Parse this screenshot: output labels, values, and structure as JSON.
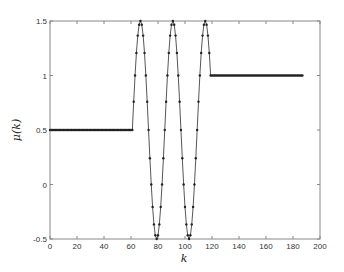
{
  "chart_data": {
    "type": "line",
    "title": "",
    "xlabel": "k",
    "ylabel": "μ(k)",
    "xlim": [
      0,
      200
    ],
    "ylim": [
      -0.5,
      1.5
    ],
    "xticks": [
      0,
      20,
      40,
      60,
      80,
      100,
      120,
      140,
      160,
      180,
      200
    ],
    "yticks": [
      -0.5,
      0,
      0.5,
      1,
      1.5
    ],
    "xtick_labels": [
      "0",
      "20",
      "40",
      "60",
      "80",
      "100",
      "120",
      "140",
      "160",
      "180",
      "200"
    ],
    "ytick_labels": [
      "-0.5",
      "0",
      "0.5",
      "1",
      "1.5"
    ],
    "grid": false,
    "legend": null,
    "series": [
      {
        "name": "μ(k)",
        "marker": "dot",
        "line_color": "#444444",
        "marker_color": "#222222",
        "segments": [
          {
            "k_start": 0,
            "k_end": 60,
            "value": 0.5
          },
          {
            "k_start": 61,
            "k_end": 118,
            "formula": "0.5 + cos(2π(k-67)/24)"
          },
          {
            "k_start": 119,
            "k_end": 187,
            "value": 1.0
          }
        ],
        "oscillation_k": [
          61,
          62,
          63,
          64,
          65,
          66,
          67,
          68,
          69,
          70,
          71,
          72,
          73,
          74,
          75,
          76,
          77,
          78,
          79,
          80,
          81,
          82,
          83,
          84,
          85,
          86,
          87,
          88,
          89,
          90,
          91,
          92,
          93,
          94,
          95,
          96,
          97,
          98,
          99,
          100,
          101,
          102,
          103,
          104,
          105,
          106,
          107,
          108,
          109,
          110,
          111,
          112,
          113,
          114,
          115,
          116,
          117,
          118
        ],
        "oscillation_values": [
          0.5,
          0.759,
          1.0,
          1.207,
          1.366,
          1.466,
          1.5,
          1.466,
          1.366,
          1.207,
          1.0,
          0.759,
          0.5,
          0.241,
          0.0,
          -0.207,
          -0.366,
          -0.466,
          -0.5,
          -0.466,
          -0.366,
          -0.207,
          0.0,
          0.241,
          0.5,
          0.759,
          1.0,
          1.207,
          1.366,
          1.466,
          1.5,
          1.466,
          1.366,
          1.207,
          1.0,
          0.759,
          0.5,
          0.241,
          0.0,
          -0.207,
          -0.366,
          -0.466,
          -0.5,
          -0.466,
          -0.366,
          -0.207,
          0.0,
          0.241,
          0.5,
          0.759,
          1.0,
          1.207,
          1.366,
          1.466,
          1.5,
          1.466,
          1.366,
          1.207
        ],
        "peaks_k": [
          67,
          91,
          115
        ],
        "troughs_k": [
          79,
          103
        ]
      }
    ]
  }
}
